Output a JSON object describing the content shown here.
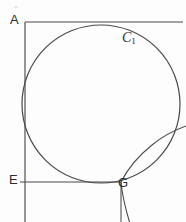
{
  "figure": {
    "canvas": {
      "width": 186,
      "height": 222,
      "background": "#fdfdfd"
    },
    "stroke_color": "#4a4a4a",
    "label_color": "#2b2b2b",
    "labels": {
      "a": "A",
      "e": "E",
      "g": "G",
      "c1_base": "C",
      "c1_sub": "1"
    },
    "geometry": {
      "vertical_line_left": {
        "x": 25,
        "y1": 22,
        "y2": 222
      },
      "horizontal_line_top": {
        "y": 22,
        "x1": 25,
        "x2": 183
      },
      "horizontal_line_e": {
        "y": 182,
        "x1": 20,
        "x2": 121
      },
      "vertical_line_g": {
        "x": 121,
        "y1": 182,
        "y2": 222
      },
      "circle": {
        "cx": 101,
        "cy": 104,
        "r": 79
      },
      "tangent_curve": {
        "description": "hyperbola-like curve tangent near G rising to the right",
        "points": [
          [
            129,
            222
          ],
          [
            124,
            205
          ],
          [
            121.5,
            190
          ],
          [
            121,
            182
          ],
          [
            124,
            172
          ],
          [
            133,
            159
          ],
          [
            148,
            146
          ],
          [
            165,
            136
          ],
          [
            186,
            127
          ]
        ],
        "lower_branch": [
          [
            121,
            182
          ],
          [
            123,
            196
          ],
          [
            126,
            210
          ],
          [
            129,
            222
          ]
        ]
      }
    }
  }
}
